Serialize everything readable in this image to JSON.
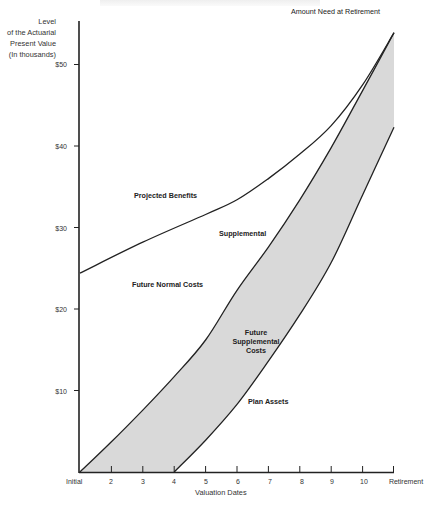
{
  "chart_data": {
    "type": "area",
    "title": "",
    "ylabel": "Level of the Actuarial Present Value (In thousands)",
    "ylabel_lines": [
      "Level",
      "of the Actuarial",
      "Present Value",
      "(In thousands)"
    ],
    "xlabel": "Valuation Dates",
    "x_categories": [
      "Initial",
      "2",
      "3",
      "4",
      "5",
      "6",
      "7",
      "8",
      "9",
      "10",
      "Retirement"
    ],
    "x": [
      1,
      2,
      3,
      4,
      5,
      6,
      7,
      8,
      9,
      10,
      11
    ],
    "y_ticks": [
      "$10",
      "$20",
      "$30",
      "$40",
      "$50"
    ],
    "y_tick_values": [
      10,
      20,
      30,
      40,
      50
    ],
    "ylim": [
      0,
      55
    ],
    "grid": false,
    "legend": "none (inline annotations)",
    "series": [
      {
        "name": "Projected Benefits",
        "points": [
          [
            1,
            24.4
          ],
          [
            3,
            28.2
          ],
          [
            5,
            31.6
          ],
          [
            6,
            33.4
          ],
          [
            7,
            36.0
          ],
          [
            8,
            39.0
          ],
          [
            9,
            42.5
          ],
          [
            10,
            47.5
          ],
          [
            11,
            53.9
          ]
        ]
      },
      {
        "name": "Supplemental",
        "points": [
          [
            1,
            0
          ],
          [
            2,
            3.7
          ],
          [
            3,
            7.6
          ],
          [
            4,
            11.7
          ],
          [
            5,
            16.2
          ],
          [
            6,
            22.3
          ],
          [
            7,
            27.6
          ],
          [
            8,
            33.4
          ],
          [
            9,
            39.8
          ],
          [
            10,
            46.8
          ],
          [
            11,
            53.9
          ]
        ]
      },
      {
        "name": "Plan Assets",
        "points": [
          [
            4,
            0
          ],
          [
            5,
            3.9
          ],
          [
            6,
            8.3
          ],
          [
            7,
            13.6
          ],
          [
            8,
            19.3
          ],
          [
            9,
            25.7
          ],
          [
            10,
            34.0
          ],
          [
            11,
            42.3
          ]
        ]
      }
    ],
    "shaded_region": {
      "name": "Future Supplemental Costs",
      "between": [
        "Supplemental",
        "Plan Assets"
      ],
      "color": "#d9d9d9"
    },
    "annotations": [
      {
        "text": "Amount Need at Retirement",
        "x": 11,
        "y": 53.9
      },
      {
        "text": "Projected Benefits",
        "x": 3.8,
        "y": 37
      },
      {
        "text": "Supplemental",
        "x": 6.2,
        "y": 29
      },
      {
        "text": "Future Normal Costs",
        "x": 3.8,
        "y": 22
      },
      {
        "text": "Future Supplemental Costs",
        "x": 6.3,
        "y": 17
      },
      {
        "text": "Plan Assets",
        "x": 7.9,
        "y": 8.7
      }
    ]
  },
  "labels": {
    "ylabel": [
      "Level",
      "of the Actuarial",
      "Present Value",
      "(In thousands)"
    ],
    "yticks": [
      "$50",
      "$40",
      "$30",
      "$20",
      "$10"
    ],
    "xticks": [
      "Initial",
      "2",
      "3",
      "4",
      "5",
      "6",
      "7",
      "8",
      "9",
      "10",
      "Retirement"
    ],
    "xlabel": "Valuation Dates",
    "amount_need": "Amount Need at Retirement",
    "projected_benefits": "Projected Benefits",
    "supplemental": "Supplemental",
    "future_normal_costs": "Future Normal Costs",
    "future_supplemental_costs": [
      "Future",
      "Supplemental",
      "Costs"
    ],
    "plan_assets": "Plan Assets"
  },
  "colors": {
    "line": "#222222",
    "shade": "#d9d9d9",
    "background": "#ffffff"
  }
}
